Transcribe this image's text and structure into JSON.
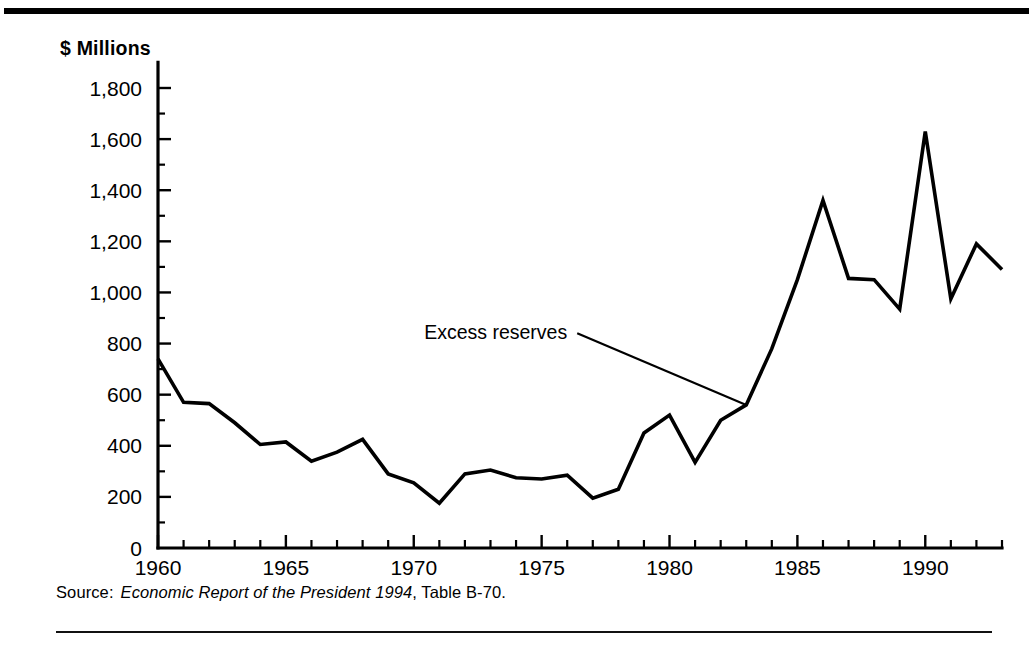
{
  "figure": {
    "y_axis_title": "$ Millions",
    "source": {
      "label": "Source:",
      "title_italic": "Economic Report of the President 1994",
      "tail": ", Table B-70."
    }
  },
  "chart_data": {
    "type": "line",
    "title": "",
    "xlabel": "",
    "ylabel": "$ Millions",
    "ylim": [
      0,
      1900
    ],
    "xlim": [
      1960,
      1993
    ],
    "grid": false,
    "legend_position": "inline-annotation",
    "annotations": [
      {
        "text": "Excess reserves",
        "points_to_x": 1983.0,
        "points_to_y": 560,
        "label_x": 1976.0,
        "label_y": 840
      }
    ],
    "y_ticks": [
      0,
      200,
      400,
      600,
      800,
      1000,
      1200,
      1400,
      1600,
      1800
    ],
    "y_tick_labels": [
      "0",
      "200",
      "400",
      "600",
      "800",
      "1,000",
      "1,200",
      "1,400",
      "1,600",
      "1,800"
    ],
    "y_minor_tick_step": 100,
    "x_ticks": [
      1960,
      1965,
      1970,
      1975,
      1980,
      1985,
      1990
    ],
    "x_tick_labels": [
      "1960",
      "1965",
      "1970",
      "1975",
      "1980",
      "1985",
      "1990"
    ],
    "x_minor_tick_step": 1,
    "series": [
      {
        "name": "Excess reserves",
        "x": [
          1960,
          1961,
          1962,
          1963,
          1964,
          1965,
          1966,
          1967,
          1968,
          1969,
          1970,
          1971,
          1972,
          1973,
          1974,
          1975,
          1976,
          1977,
          1978,
          1979,
          1980,
          1981,
          1982,
          1983,
          1984,
          1985,
          1986,
          1987,
          1988,
          1989,
          1990,
          1991,
          1992,
          1993
        ],
        "values": [
          740,
          570,
          565,
          490,
          405,
          415,
          340,
          375,
          425,
          290,
          255,
          175,
          290,
          305,
          275,
          270,
          285,
          195,
          230,
          450,
          520,
          335,
          500,
          560,
          780,
          1050,
          1360,
          1055,
          1050,
          935,
          1630,
          975,
          1190,
          1090
        ]
      }
    ]
  }
}
